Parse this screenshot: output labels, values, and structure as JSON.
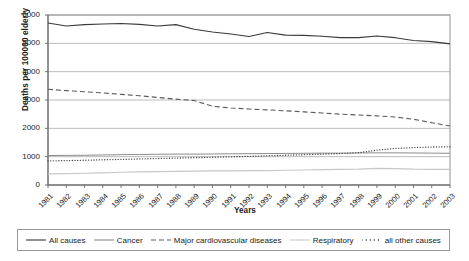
{
  "chart_data": {
    "type": "line",
    "title": "",
    "xlabel": "Years",
    "ylabel": "Deaths per 100000 elderly",
    "ylim": [
      0,
      6000
    ],
    "ytick_step": 1000,
    "yticks": [
      "6000",
      "5000",
      "4000",
      "3000",
      "2000",
      "1000",
      "0"
    ],
    "grid": true,
    "grid_axis": "y",
    "legend_position": "bottom",
    "x": [
      "1981",
      "1982",
      "1983",
      "1984",
      "1985",
      "1986",
      "1987",
      "1988",
      "1989",
      "1990",
      "1991",
      "1992",
      "1993",
      "1994",
      "1995",
      "1996",
      "1997",
      "1998",
      "1999",
      "2000",
      "2001",
      "2002",
      "2003"
    ],
    "series": [
      {
        "name": "All causes",
        "style": "solid",
        "color": "#3a3a3a",
        "width": 1.1,
        "values": [
          5720,
          5610,
          5660,
          5680,
          5700,
          5670,
          5610,
          5660,
          5500,
          5400,
          5330,
          5240,
          5380,
          5290,
          5280,
          5250,
          5200,
          5200,
          5260,
          5200,
          5100,
          5060,
          4980
        ]
      },
      {
        "name": "Cancer",
        "style": "solid",
        "color": "#8c8c8c",
        "width": 1.0,
        "values": [
          1040,
          1045,
          1050,
          1060,
          1070,
          1075,
          1085,
          1090,
          1090,
          1095,
          1100,
          1105,
          1110,
          1115,
          1120,
          1125,
          1125,
          1130,
          1135,
          1135,
          1130,
          1125,
          1120
        ]
      },
      {
        "name": "Major cardiovascular diseases",
        "style": "dashed",
        "color": "#5a5a5a",
        "width": 1.1,
        "values": [
          3380,
          3330,
          3290,
          3250,
          3200,
          3150,
          3090,
          3030,
          2980,
          2780,
          2720,
          2680,
          2650,
          2620,
          2580,
          2540,
          2500,
          2470,
          2440,
          2400,
          2320,
          2200,
          2080
        ]
      },
      {
        "name": "Respiratory",
        "style": "solid",
        "color": "#c8c8c8",
        "width": 1.2,
        "values": [
          390,
          400,
          415,
          430,
          450,
          460,
          470,
          480,
          490,
          495,
          500,
          505,
          510,
          520,
          530,
          540,
          550,
          560,
          590,
          580,
          560,
          555,
          550
        ]
      },
      {
        "name": "all other causes",
        "style": "dotted",
        "color": "#404040",
        "width": 1.3,
        "values": [
          850,
          860,
          875,
          890,
          905,
          920,
          935,
          950,
          965,
          980,
          995,
          1010,
          1030,
          1050,
          1070,
          1090,
          1110,
          1140,
          1230,
          1290,
          1320,
          1340,
          1350
        ]
      }
    ]
  },
  "axes": {
    "y_title": "Deaths per 100000 elderly",
    "x_title": "Years"
  },
  "legend": {
    "items": [
      {
        "label": "All causes",
        "style": "solid",
        "color": "#3a3a3a"
      },
      {
        "label": "Cancer",
        "style": "solid",
        "color": "#8c8c8c"
      },
      {
        "label": "Major cardiovascular diseases",
        "style": "dashed",
        "color": "#5a5a5a"
      },
      {
        "label": "Respiratory",
        "style": "solid",
        "color": "#c8c8c8"
      },
      {
        "label": "all other causes",
        "style": "dotted",
        "color": "#404040"
      }
    ]
  }
}
